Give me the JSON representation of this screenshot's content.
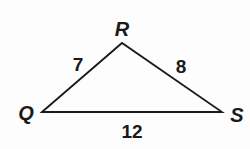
{
  "diagram": {
    "type": "triangle",
    "stroke_color": "#1a1a1a",
    "vertices": [
      {
        "name": "R",
        "x": 122,
        "y": 43,
        "label_x": 122,
        "label_y": 36
      },
      {
        "name": "Q",
        "x": 42,
        "y": 112,
        "label_x": 26,
        "label_y": 120
      },
      {
        "name": "S",
        "x": 222,
        "y": 112,
        "label_x": 237,
        "label_y": 122
      }
    ],
    "sides": [
      {
        "between": "QR",
        "length": "7",
        "label_x": 78,
        "label_y": 71
      },
      {
        "between": "RS",
        "length": "8",
        "label_x": 181,
        "label_y": 73
      },
      {
        "between": "QS",
        "length": "12",
        "label_x": 132,
        "label_y": 138
      }
    ]
  }
}
